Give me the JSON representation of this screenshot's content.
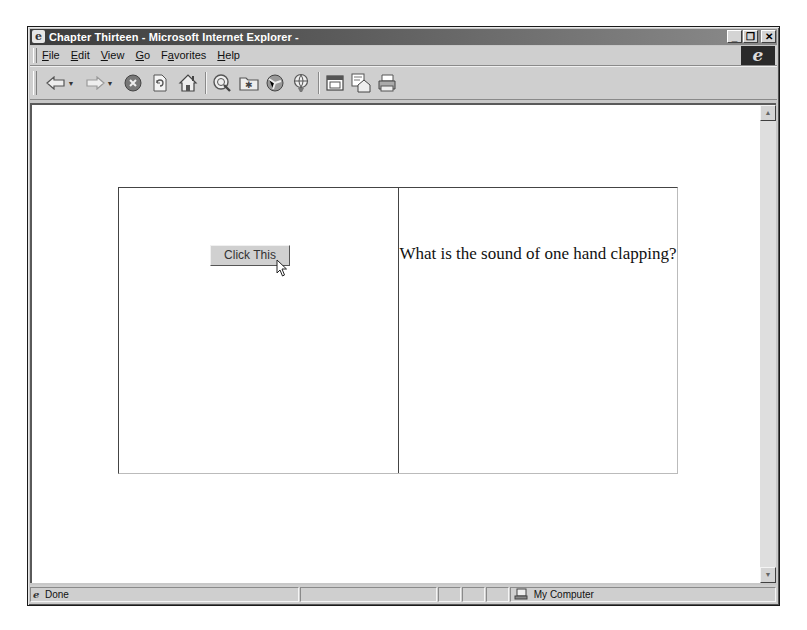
{
  "window": {
    "title": "Chapter Thirteen - Microsoft Internet Explorer -",
    "controls": {
      "minimize": "_",
      "maximize": "❐",
      "close": "✕"
    }
  },
  "menubar": {
    "items": [
      {
        "label": "File",
        "accel": "F"
      },
      {
        "label": "Edit",
        "accel": "E"
      },
      {
        "label": "View",
        "accel": "V"
      },
      {
        "label": "Go",
        "accel": "G"
      },
      {
        "label": "Favorites",
        "accel": "a"
      },
      {
        "label": "Help",
        "accel": "H"
      }
    ],
    "brand_logo": "e"
  },
  "toolbar": {
    "buttons": [
      "back-icon",
      "forward-icon",
      "stop-icon",
      "refresh-icon",
      "home-icon",
      "search-icon",
      "favorites-icon",
      "history-icon",
      "channels-icon",
      "fullscreen-icon",
      "mail-icon",
      "print-icon"
    ]
  },
  "page": {
    "button_label": "Click This",
    "question_text": "What is the sound of one hand clapping?"
  },
  "statusbar": {
    "status_text": "Done",
    "zone_text": "My Computer"
  }
}
